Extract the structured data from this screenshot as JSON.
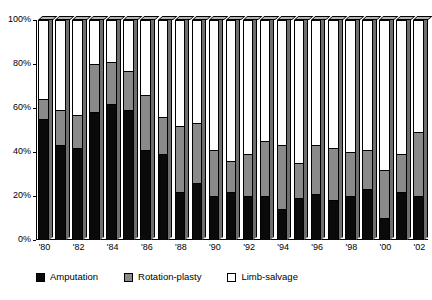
{
  "chart_data": {
    "type": "bar",
    "subtype": "stacked-100-percent",
    "title": "",
    "xlabel": "",
    "ylabel": "",
    "ylim": [
      0,
      100
    ],
    "yticks": [
      "0%",
      "20%",
      "40%",
      "60%",
      "80%",
      "100%"
    ],
    "ytick_values": [
      0,
      20,
      40,
      60,
      80,
      100
    ],
    "grid": false,
    "legend_position": "bottom",
    "categories": [
      "'80",
      "'81",
      "'82",
      "'83",
      "'84",
      "'85",
      "'86",
      "'87",
      "'88",
      "'89",
      "'90",
      "'91",
      "'92",
      "'93",
      "'94",
      "'95",
      "'96",
      "'97",
      "'98",
      "'99",
      "'00",
      "'01",
      "'02"
    ],
    "xtick_labels_shown": [
      "'80",
      "'82",
      "'84",
      "'86",
      "'88",
      "'90",
      "'92",
      "'94",
      "'96",
      "'98",
      "'00",
      "'02"
    ],
    "series": [
      {
        "name": "Amputation",
        "color": "#0a0a0a",
        "values": [
          55,
          43,
          42,
          58,
          62,
          59,
          41,
          39,
          22,
          26,
          20,
          22,
          20,
          20,
          14,
          19,
          21,
          18,
          20,
          23,
          10,
          22,
          20
        ]
      },
      {
        "name": "Rotation-plasty",
        "color": "#8a8a8a",
        "values": [
          9,
          16,
          15,
          22,
          19,
          18,
          25,
          17,
          30,
          27,
          21,
          14,
          19,
          25,
          29,
          16,
          22,
          24,
          20,
          18,
          22,
          17,
          29
        ]
      },
      {
        "name": "Limb-salvage",
        "color": "#ffffff",
        "values": [
          36,
          41,
          43,
          20,
          19,
          23,
          34,
          44,
          48,
          47,
          59,
          64,
          61,
          55,
          57,
          65,
          57,
          58,
          60,
          59,
          68,
          61,
          51
        ]
      }
    ]
  },
  "legend": {
    "items": [
      {
        "label": "Amputation",
        "swatch": "amputation-swatch"
      },
      {
        "label": "Rotation-plasty",
        "swatch": "rotation-plasty-swatch"
      },
      {
        "label": "Limb-salvage",
        "swatch": "limb-salvage-swatch"
      }
    ]
  }
}
